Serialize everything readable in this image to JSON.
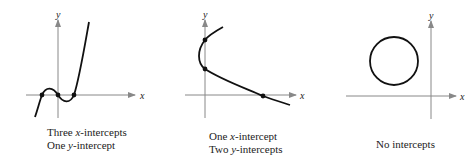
{
  "panels": [
    {
      "id": "cubic",
      "axis_labels": {
        "x": "x",
        "y": "y"
      },
      "caption_lines": [
        {
          "pre": "Three ",
          "var": "x",
          "post": "-intercepts"
        },
        {
          "pre": "One ",
          "var": "y",
          "post": "-intercept"
        }
      ]
    },
    {
      "id": "sideways-parabola",
      "axis_labels": {
        "x": "x",
        "y": "y"
      },
      "caption_lines": [
        {
          "pre": "One ",
          "var": "x",
          "post": "-intercept"
        },
        {
          "pre": "Two ",
          "var": "y",
          "post": "-intercepts"
        }
      ]
    },
    {
      "id": "circle",
      "axis_labels": {
        "x": "x",
        "y": "y"
      },
      "caption_lines": [
        {
          "pre": "No intercepts",
          "var": "",
          "post": ""
        }
      ]
    }
  ],
  "colors": {
    "axis": "#888888",
    "curve": "#111111",
    "text": "#222222"
  }
}
